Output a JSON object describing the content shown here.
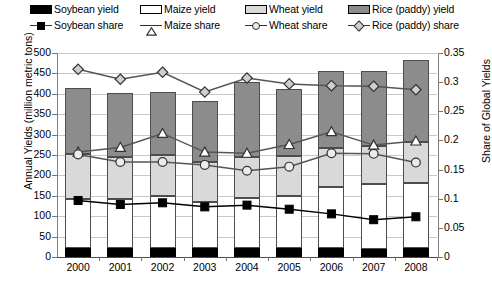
{
  "legend": {
    "row1": [
      {
        "name": "soybean-yield",
        "label": "Soybean yield",
        "color": "#000000"
      },
      {
        "name": "maize-yield",
        "label": "Maize yield",
        "color": "#ffffff"
      },
      {
        "name": "wheat-yield",
        "label": "Wheat yield",
        "color": "#d9d9d9"
      },
      {
        "name": "rice-yield",
        "label": "Rice (paddy) yield",
        "color": "#8c8c8c"
      }
    ],
    "row2": [
      {
        "name": "soybean-share",
        "label": "Soybean share",
        "marker": "filled-square"
      },
      {
        "name": "maize-share",
        "label": "Maize share",
        "marker": "open-triangle"
      },
      {
        "name": "wheat-share",
        "label": "Wheat share",
        "marker": "open-circle"
      },
      {
        "name": "rice-share",
        "label": "Rice (paddy) share",
        "marker": "open-diamond"
      }
    ]
  },
  "axes": {
    "left_title": "Annual Yields (million metric tons)",
    "right_title": "Share of Global Yields",
    "left_ticks": [
      "500",
      "450",
      "400",
      "350",
      "300",
      "250",
      "200",
      "150",
      "100",
      "50",
      "0"
    ],
    "right_ticks": [
      "0.35",
      "0.3",
      "0.25",
      "0.2",
      "0.15",
      "0.1",
      "0.05",
      "0"
    ],
    "x_labels": [
      "2000",
      "2001",
      "2002",
      "2003",
      "2004",
      "2005",
      "2006",
      "2007",
      "2008"
    ]
  },
  "chart_data": {
    "type": "bar",
    "title": "",
    "xlabel": "",
    "ylabel": "Annual Yields (million metric tons)",
    "y2label": "Share of Global Yields",
    "ylim": [
      0,
      500
    ],
    "y2lim": [
      0,
      0.35
    ],
    "grid": true,
    "stacked": true,
    "legend_position": "top",
    "categories": [
      "2000",
      "2001",
      "2002",
      "2003",
      "2004",
      "2005",
      "2006",
      "2007",
      "2008"
    ],
    "series": [
      {
        "name": "Soybean yield",
        "axis": "left",
        "kind": "bar",
        "color": "#000000",
        "values": [
          22,
          22,
          22,
          22,
          22,
          22,
          22,
          20,
          22
        ]
      },
      {
        "name": "Maize yield",
        "axis": "left",
        "kind": "bar",
        "color": "#ffffff",
        "values": [
          120,
          120,
          128,
          114,
          123,
          128,
          150,
          158,
          160
        ]
      },
      {
        "name": "Wheat yield",
        "axis": "left",
        "kind": "bar",
        "color": "#d9d9d9",
        "values": [
          110,
          104,
          100,
          96,
          100,
          98,
          95,
          94,
          100
        ]
      },
      {
        "name": "Rice (paddy) yield",
        "axis": "left",
        "kind": "bar",
        "color": "#8c8c8c",
        "values": [
          162,
          157,
          154,
          150,
          185,
          164,
          188,
          184,
          200
        ]
      },
      {
        "name": "Soybean share",
        "axis": "right",
        "kind": "line",
        "marker": "filled-square",
        "values": [
          0.097,
          0.09,
          0.093,
          0.086,
          0.089,
          0.082,
          0.074,
          0.064,
          0.069
        ]
      },
      {
        "name": "Maize share",
        "axis": "right",
        "kind": "line",
        "marker": "open-triangle",
        "values": [
          0.18,
          0.188,
          0.212,
          0.18,
          0.178,
          0.193,
          0.215,
          0.192,
          0.199
        ]
      },
      {
        "name": "Wheat share",
        "axis": "right",
        "kind": "line",
        "marker": "open-circle",
        "values": [
          0.176,
          0.163,
          0.163,
          0.158,
          0.148,
          0.155,
          0.178,
          0.177,
          0.162
        ]
      },
      {
        "name": "Rice (paddy) share",
        "axis": "right",
        "kind": "line",
        "marker": "open-diamond",
        "values": [
          0.322,
          0.305,
          0.317,
          0.283,
          0.307,
          0.297,
          0.294,
          0.293,
          0.287
        ]
      }
    ],
    "bar_totals": [
      414,
      403,
      404,
      382,
      430,
      412,
      455,
      456,
      482
    ]
  }
}
